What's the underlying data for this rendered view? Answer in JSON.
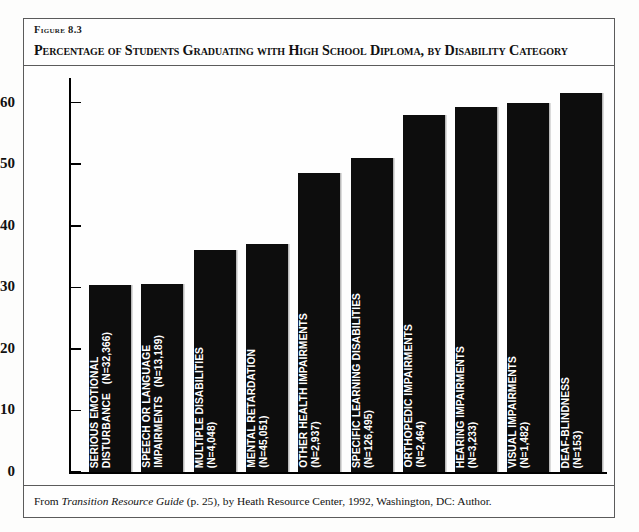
{
  "figure": {
    "number_label": "Figure 8.3",
    "title": "Percentage of Students Graduating with High School Diploma, by Disability Category",
    "source_note_prefix": "From ",
    "source_note_italic": "Transition Resource Guide",
    "source_note_suffix": " (p. 25), by Heath Resource Center, 1992, Washington, DC: Author."
  },
  "chart_data": {
    "type": "bar",
    "title": "Percentage of Students Graduating with High School Diploma, by Disability Category",
    "xlabel": "",
    "ylabel": "",
    "ylim": [
      0,
      64
    ],
    "yticks": [
      0,
      10,
      20,
      30,
      40,
      50,
      60
    ],
    "grid": false,
    "legend": "none",
    "bar_color": "#0d0d0d",
    "categories": [
      "Serious Emotional Disturbance",
      "Speech or Language Impairments",
      "Multiple Disabilities",
      "Mental Retardation",
      "Other Health Impairments",
      "Specific Learning Disabilities",
      "Orthopedic Impairments",
      "Hearing Impairments",
      "Visual Impairments",
      "Deaf-Blindness"
    ],
    "category_labels": [
      "SERIOUS EMOTIONAL\nDISTURBANCE   (N=32,366)",
      "SPEECH OR LANGUAGE\nIMPAIRMENTS   (N=13,189)",
      "MULTIPLE DISABILITIES\n(N=4,048)",
      "MENTAL RETARDATION\n(N=45,051)",
      "OTHER HEALTH IMPAIRMENTS\n(N=2,937)",
      "SPECIFIC LEARNING DISABILITIES\n(N=126,495)",
      "ORTHOPEDIC IMPAIRMENTS\n(N=2,464)",
      "HEARING IMPAIRMENTS\n(N=3,233)",
      "VISUAL IMPAIRMENTS\n(N=1,482)",
      "DEAF-BLINDNESS\n(N=153)"
    ],
    "n_values": [
      "N=32,366",
      "N=13,189",
      "N=4,048",
      "N=45,051",
      "N=2,937",
      "N=126,495",
      "N=2,464",
      "N=3,233",
      "N=1,482",
      "N=153"
    ],
    "values": [
      30.4,
      30.5,
      36.0,
      37.0,
      48.5,
      51.0,
      58.0,
      59.3,
      60.0,
      61.6
    ]
  }
}
